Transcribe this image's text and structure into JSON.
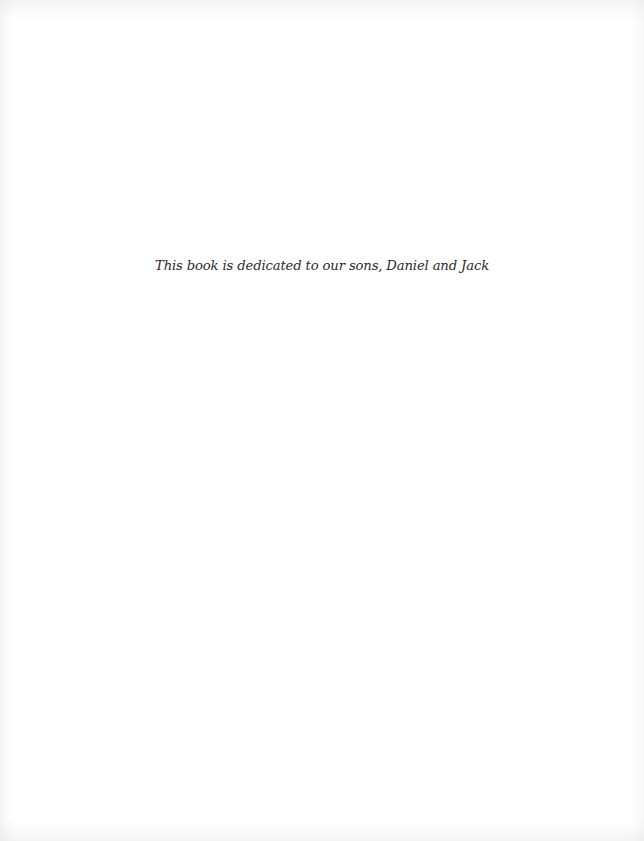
{
  "page": {
    "type": "dedication-page",
    "dedication_text": "This book is dedicated to our sons, Daniel and Jack"
  },
  "colors": {
    "background": "#ffffff",
    "text": "#2a2a2a"
  }
}
